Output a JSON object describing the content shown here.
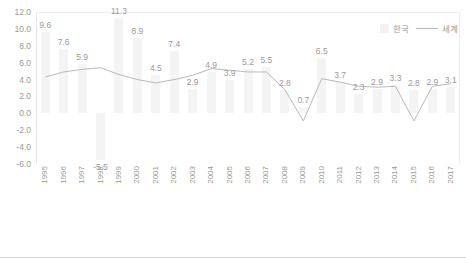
{
  "chart_data": {
    "type": "bar",
    "title": "",
    "xlabel": "",
    "ylabel": "",
    "ylim": [
      -6.0,
      12.0
    ],
    "y_ticks": [
      "12.0",
      "10.0",
      "8.0",
      "6.0",
      "4.0",
      "2.0",
      "0.0",
      "-2.0",
      "-4.0",
      "-6.0"
    ],
    "grid": false,
    "legend_position": "top-right",
    "categories": [
      "1995",
      "1996",
      "1997",
      "1998",
      "1999",
      "2000",
      "2001",
      "2002",
      "2003",
      "2004",
      "2005",
      "2006",
      "2007",
      "2008",
      "2009",
      "2010",
      "2011",
      "2012",
      "2013",
      "2014",
      "2015",
      "2016",
      "2017"
    ],
    "series": [
      {
        "name": "한국",
        "type": "bar",
        "values": [
          9.6,
          7.6,
          5.9,
          -5.5,
          11.3,
          8.9,
          4.5,
          7.4,
          2.9,
          4.9,
          3.9,
          5.2,
          5.5,
          2.8,
          0.7,
          6.5,
          3.7,
          2.3,
          2.9,
          3.3,
          2.8,
          2.9,
          3.1
        ],
        "labels": [
          "9.6",
          "7.6",
          "5.9",
          "-5.5",
          "11.3",
          "8.9",
          "4.5",
          "7.4",
          "2.9",
          "4.9",
          "3.9",
          "5.2",
          "5.5",
          "2.8",
          "0.7",
          "6.5",
          "3.7",
          "2.3",
          "2.9",
          "3.3",
          "2.8",
          "2.9",
          "3.1"
        ],
        "color": "#f4f4f4"
      },
      {
        "name": "세계",
        "type": "line",
        "values": [
          4.3,
          4.9,
          5.2,
          5.4,
          4.6,
          4.0,
          3.6,
          4.0,
          4.5,
          5.3,
          5.1,
          4.9,
          4.9,
          2.8,
          -0.9,
          4.1,
          3.7,
          3.2,
          3.1,
          3.2,
          -0.9,
          3.2,
          3.5
        ],
        "color": "#b9b9b9"
      }
    ]
  },
  "legend": {
    "bar_series_label": "한국",
    "line_series_label": "세계"
  }
}
